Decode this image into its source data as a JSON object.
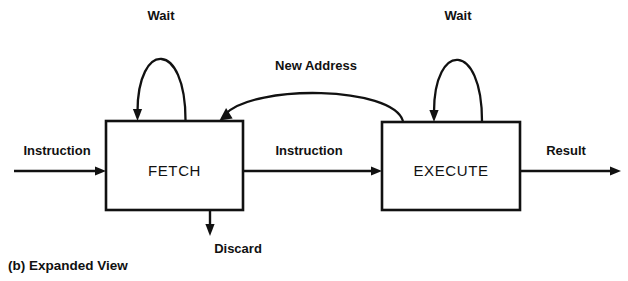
{
  "figure": {
    "caption": "(b)  Expanded View",
    "background_color": "#ffffff",
    "line_color": "#111111"
  },
  "nodes": [
    {
      "id": "fetch",
      "label": "FETCH"
    },
    {
      "id": "execute",
      "label": "EXECUTE"
    }
  ],
  "edges": [
    {
      "id": "input-instruction",
      "label": "Instruction",
      "from": "external-input",
      "to": "fetch"
    },
    {
      "id": "fetch-wait",
      "label": "Wait",
      "from": "fetch",
      "to": "fetch"
    },
    {
      "id": "fetch-discard",
      "label": "Discard",
      "from": "fetch",
      "to": "external-output"
    },
    {
      "id": "fetch-to-execute",
      "label": "Instruction",
      "from": "fetch",
      "to": "execute"
    },
    {
      "id": "execute-to-fetch",
      "label": "New Address",
      "from": "execute",
      "to": "fetch"
    },
    {
      "id": "execute-wait",
      "label": "Wait",
      "from": "execute",
      "to": "execute"
    },
    {
      "id": "execute-result",
      "label": "Result",
      "from": "execute",
      "to": "external-output"
    }
  ],
  "labels": {
    "wait_left": "Wait",
    "wait_right": "Wait",
    "new_address": "New Address",
    "instruction_in": "Instruction",
    "instruction_mid": "Instruction",
    "result": "Result",
    "discard": "Discard",
    "fetch": "FETCH",
    "execute": "EXECUTE",
    "caption": "(b)  Expanded View"
  }
}
